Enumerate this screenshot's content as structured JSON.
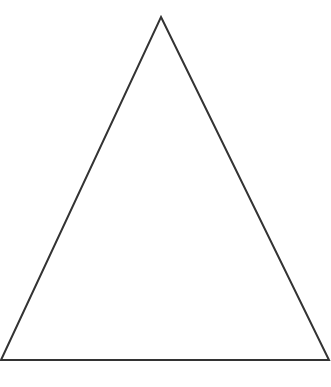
{
  "diagram": {
    "type": "triangle",
    "shape": "isosceles-triangle",
    "background": "#ffffff",
    "stroke_color": "#333333",
    "stroke_width": 2,
    "fill": "none",
    "vertices": {
      "apex": {
        "x": 161,
        "y": 17
      },
      "bottom_left": {
        "x": 1,
        "y": 360
      },
      "bottom_right": {
        "x": 329,
        "y": 360
      }
    },
    "labels": []
  }
}
